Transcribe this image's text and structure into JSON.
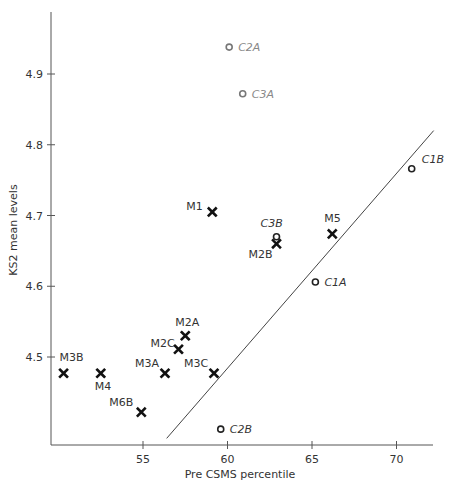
{
  "chart_data": {
    "type": "scatter",
    "title": "",
    "xlabel": "Pre CSMS percentile",
    "ylabel": "KS2 mean levels",
    "xlim": [
      50,
      72.5
    ],
    "ylim": [
      4.37,
      4.99
    ],
    "xticks": [
      55,
      60,
      65,
      70
    ],
    "yticks": [
      4.5,
      4.6,
      4.7,
      4.8,
      4.9
    ],
    "grid": false,
    "legend": null,
    "series": [
      {
        "name": "M groups",
        "marker": "cross",
        "points": [
          {
            "label": "M1",
            "x": 59.1,
            "y": 4.705
          },
          {
            "label": "M2A",
            "x": 57.5,
            "y": 4.53
          },
          {
            "label": "M2B",
            "x": 62.9,
            "y": 4.66
          },
          {
            "label": "M2C",
            "x": 57.1,
            "y": 4.511
          },
          {
            "label": "M3A",
            "x": 56.3,
            "y": 4.477
          },
          {
            "label": "M3B",
            "x": 50.3,
            "y": 4.477
          },
          {
            "label": "M3C",
            "x": 59.2,
            "y": 4.477
          },
          {
            "label": "M4",
            "x": 52.5,
            "y": 4.477
          },
          {
            "label": "M5",
            "x": 66.2,
            "y": 4.674
          },
          {
            "label": "M6B",
            "x": 54.9,
            "y": 4.422
          }
        ]
      },
      {
        "name": "C groups",
        "marker": "open-circle",
        "points": [
          {
            "label": "C1A",
            "x": 65.2,
            "y": 4.606
          },
          {
            "label": "C1B",
            "x": 70.9,
            "y": 4.766
          },
          {
            "label": "C2A",
            "x": 60.1,
            "y": 4.938
          },
          {
            "label": "C2B",
            "x": 59.6,
            "y": 4.398
          },
          {
            "label": "C3A",
            "x": 60.9,
            "y": 4.872
          },
          {
            "label": "C3B",
            "x": 62.9,
            "y": 4.67
          }
        ]
      }
    ],
    "annotations": [
      {
        "type": "line",
        "description": "regression/reference line",
        "from": {
          "x": 56.4,
          "y": 4.385
        },
        "to": {
          "x": 72.2,
          "y": 4.82
        }
      }
    ]
  }
}
